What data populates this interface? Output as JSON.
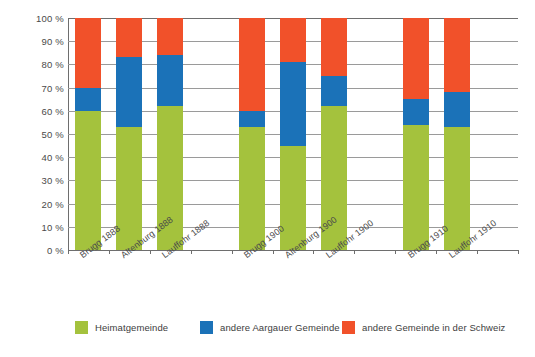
{
  "chart_data": {
    "type": "bar",
    "subtype": "stacked-percentage",
    "title": "",
    "xlabel": "",
    "ylabel": "",
    "ylim": [
      0,
      100
    ],
    "y_ticks": [
      "0 %",
      "10 %",
      "20 %",
      "30 %",
      "40 %",
      "50 %",
      "60 %",
      "70 %",
      "80 %",
      "90 %",
      "100 %"
    ],
    "y_tick_values": [
      0,
      10,
      20,
      30,
      40,
      50,
      60,
      70,
      80,
      90,
      100
    ],
    "grid": true,
    "legend_position": "bottom",
    "categories": [
      "Brugg 1888",
      "Altenburg 1888",
      "Lauffohr 1888",
      "Brugg 1900",
      "Altenburg 1900",
      "Lauffohr 1900",
      "Brugg 1910",
      "Lauffohr 1910"
    ],
    "groups": [
      {
        "year": "1888",
        "categories": [
          "Brugg 1888",
          "Altenburg 1888",
          "Lauffohr 1888"
        ]
      },
      {
        "year": "1900",
        "categories": [
          "Brugg 1900",
          "Altenburg 1900",
          "Lauffohr 1900"
        ]
      },
      {
        "year": "1910",
        "categories": [
          "Brugg 1910",
          "Lauffohr 1910"
        ]
      }
    ],
    "series": [
      {
        "name": "Heimatgemeinde",
        "color": "#a4c23d",
        "values": [
          60,
          53,
          62,
          53,
          45,
          62,
          54,
          53
        ]
      },
      {
        "name": "andere Aargauer Gemeinde",
        "color": "#1b72b8",
        "values": [
          10,
          30,
          22,
          7,
          36,
          13,
          11,
          15
        ]
      },
      {
        "name": "andere Gemeinde in der Schweiz",
        "color": "#f1512a",
        "values": [
          30,
          17,
          16,
          40,
          19,
          25,
          35,
          32
        ]
      }
    ],
    "cumulative_tops": [
      {
        "category": "Brugg 1888",
        "green_top": 60,
        "blue_top": 70,
        "orange_top": 100
      },
      {
        "category": "Altenburg 1888",
        "green_top": 53,
        "blue_top": 83,
        "orange_top": 100
      },
      {
        "category": "Lauffohr 1888",
        "green_top": 62,
        "blue_top": 84,
        "orange_top": 100
      },
      {
        "category": "Brugg 1900",
        "green_top": 53,
        "blue_top": 60,
        "orange_top": 100
      },
      {
        "category": "Altenburg 1900",
        "green_top": 45,
        "blue_top": 81,
        "orange_top": 100
      },
      {
        "category": "Lauffohr 1900",
        "green_top": 62,
        "blue_top": 75,
        "orange_top": 100
      },
      {
        "category": "Brugg 1910",
        "green_top": 54,
        "blue_top": 65,
        "orange_top": 100
      },
      {
        "category": "Lauffohr 1910",
        "green_top": 53,
        "blue_top": 68,
        "orange_top": 100
      }
    ]
  },
  "legend": {
    "items": [
      {
        "label": "Heimatgemeinde",
        "color": "#a4c23d"
      },
      {
        "label": "andere Aargauer Gemeinde",
        "color": "#1b72b8"
      },
      {
        "label": "andere Gemeinde in der Schweiz",
        "color": "#f1512a"
      }
    ]
  },
  "colors": {
    "green": "#a4c23d",
    "blue": "#1b72b8",
    "orange": "#f1512a",
    "gridline": "#9a9a9a",
    "axis": "#6e6e6e",
    "text": "#3d3d3d",
    "background": "#ffffff"
  }
}
